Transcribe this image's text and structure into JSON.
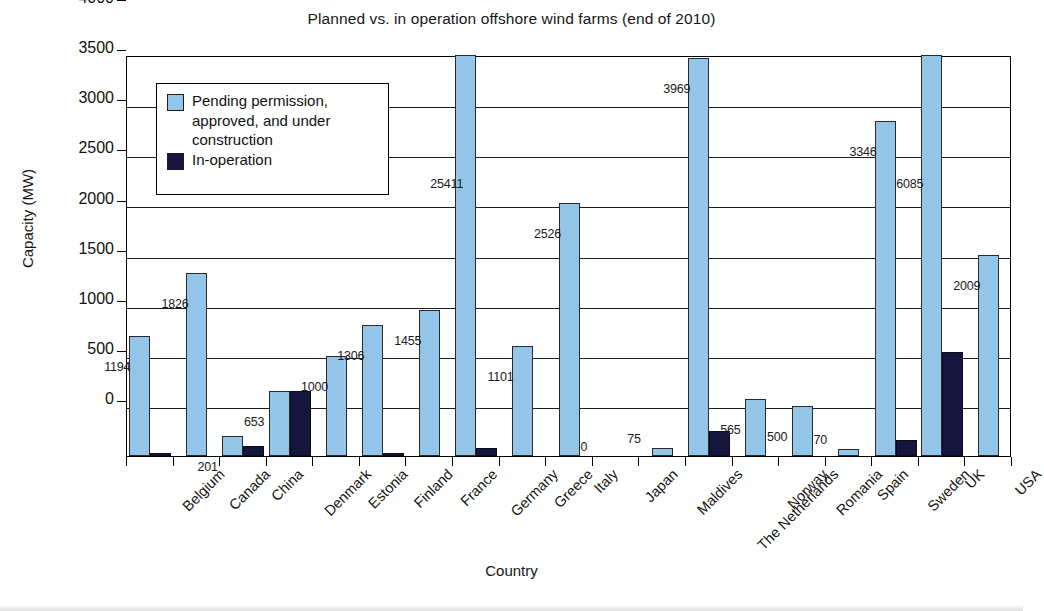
{
  "chart_data": {
    "type": "bar",
    "title": "Planned vs. in operation offshore wind farms (end of 2010)",
    "xlabel": "Country",
    "ylabel": "Capacity (MW)",
    "ylim": [
      0,
      4000
    ],
    "yticks": [
      0,
      500,
      1000,
      1500,
      2000,
      2500,
      3000,
      3500,
      4000
    ],
    "grid": true,
    "legend_position": "top-left-inside",
    "categories": [
      "Belgium",
      "Canada",
      "China",
      "Denmark",
      "Estonia",
      "Finland",
      "France",
      "Germany",
      "Greece",
      "Italy",
      "Japan",
      "Maldives",
      "The Netherlands",
      "Norway",
      "Romania",
      "Spain",
      "Sweden",
      "UK",
      "USA"
    ],
    "series": [
      {
        "name": "Pending permission, approved, and under construction",
        "color": "#92c5e8",
        "values": [
          1194,
          1826,
          201,
          653,
          1000,
          1306,
          1455,
          25411,
          1101,
          2526,
          0,
          75,
          3969,
          565,
          500,
          70,
          3346,
          6085,
          2009
        ],
        "labels": [
          "1194",
          "1826",
          "201",
          "653",
          "1000",
          "1306",
          "1455",
          "25411",
          "1101",
          "2526",
          "0",
          "75",
          "3969",
          "565",
          "500",
          "70",
          "3346",
          "6085",
          "2009"
        ]
      },
      {
        "name": "In-operation",
        "color": "#14163e",
        "values": [
          30,
          0,
          102,
          653,
          0,
          30,
          0,
          80,
          0,
          0,
          0,
          0,
          247,
          0,
          0,
          0,
          164,
          1041,
          0
        ],
        "labels": [
          "",
          "",
          "",
          "",
          "",
          "",
          "",
          "",
          "",
          "",
          "",
          "",
          "",
          "",
          "",
          "",
          "",
          "",
          ""
        ]
      }
    ]
  },
  "legend": {
    "entries": [
      {
        "label_line1": "Pending permission,",
        "label_line2": "approved, and under",
        "label_line3": "construction",
        "swatch": "light-blue-swatch"
      },
      {
        "label_line1": "In-operation",
        "swatch": "dark-navy-swatch"
      }
    ]
  },
  "colors": {
    "planned": "#92c5e8",
    "in_operation": "#14163e",
    "axis": "#000000",
    "background": "#ffffff"
  }
}
